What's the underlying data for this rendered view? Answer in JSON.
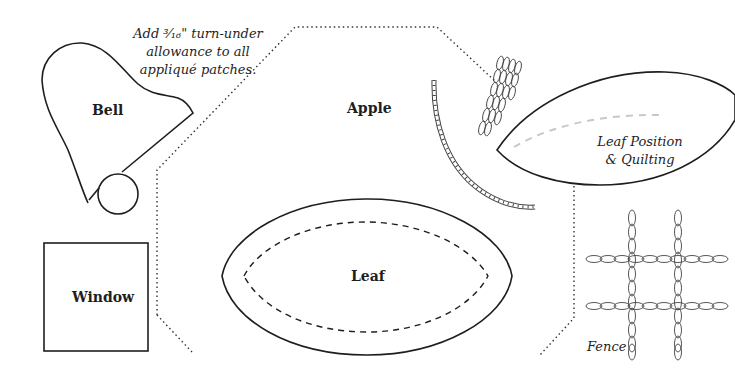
{
  "note": {
    "line1": "Add ³⁄₁₆\" turn-under",
    "line2": "allowance to all",
    "line3": "appliqué patches."
  },
  "patches": {
    "bell": "Bell",
    "apple": "Apple",
    "window": "Window",
    "leaf": "Leaf",
    "leaf_position": {
      "line1": "Leaf Position",
      "line2": "& Quilting"
    },
    "fence": "Fence"
  },
  "colors": {
    "line": "#1e1e1e",
    "quilting_line": "#c8c8c8",
    "background": "#ffffff"
  }
}
